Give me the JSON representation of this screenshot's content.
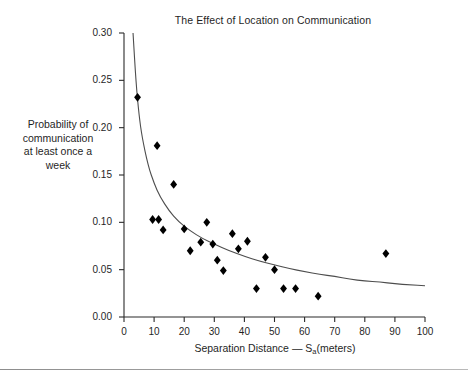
{
  "chart_data": {
    "type": "scatter",
    "title": "The Effect of Location on Communication",
    "xlabel": "Separation Distance — S",
    "xlabel_sub": "a",
    "xlabel_tail": "(meters)",
    "ylabel_lines": [
      "Probability of",
      "communication",
      "at least once a",
      "week"
    ],
    "xlim": [
      0,
      100
    ],
    "ylim": [
      0.0,
      0.3
    ],
    "xticks": [
      0,
      10,
      20,
      30,
      40,
      50,
      60,
      70,
      80,
      90,
      100
    ],
    "xtick_labels": [
      "0",
      "10",
      "20",
      "30",
      "40",
      "50",
      "60",
      "70",
      "80",
      "90",
      "100"
    ],
    "yticks": [
      0.0,
      0.05,
      0.1,
      0.15,
      0.2,
      0.25,
      0.3
    ],
    "ytick_labels": [
      "0.00",
      "0.05",
      "0.10",
      "0.15",
      "0.20",
      "0.25",
      "0.30"
    ],
    "grid": false,
    "legend": null,
    "marker": "diamond",
    "marker_color": "#000000",
    "curve_color": "#4d4d4d",
    "points": [
      {
        "x": 4.5,
        "y": 0.232
      },
      {
        "x": 11.0,
        "y": 0.181
      },
      {
        "x": 16.5,
        "y": 0.14
      },
      {
        "x": 9.5,
        "y": 0.103
      },
      {
        "x": 11.5,
        "y": 0.103
      },
      {
        "x": 13.0,
        "y": 0.092
      },
      {
        "x": 20.0,
        "y": 0.093
      },
      {
        "x": 22.0,
        "y": 0.07
      },
      {
        "x": 25.5,
        "y": 0.079
      },
      {
        "x": 27.5,
        "y": 0.1
      },
      {
        "x": 29.5,
        "y": 0.077
      },
      {
        "x": 31.0,
        "y": 0.06
      },
      {
        "x": 33.0,
        "y": 0.049
      },
      {
        "x": 36.0,
        "y": 0.088
      },
      {
        "x": 38.0,
        "y": 0.072
      },
      {
        "x": 41.0,
        "y": 0.08
      },
      {
        "x": 44.0,
        "y": 0.03
      },
      {
        "x": 47.0,
        "y": 0.063
      },
      {
        "x": 50.0,
        "y": 0.05
      },
      {
        "x": 53.0,
        "y": 0.03
      },
      {
        "x": 57.0,
        "y": 0.03
      },
      {
        "x": 64.5,
        "y": 0.022
      },
      {
        "x": 87.0,
        "y": 0.067
      }
    ],
    "fit_curve": {
      "description": "decaying fitted trend line",
      "points": [
        {
          "x": 3.0,
          "y": 0.3
        },
        {
          "x": 4.0,
          "y": 0.247
        },
        {
          "x": 5.0,
          "y": 0.213
        },
        {
          "x": 6.0,
          "y": 0.19
        },
        {
          "x": 8.0,
          "y": 0.16
        },
        {
          "x": 10.0,
          "y": 0.141
        },
        {
          "x": 12.0,
          "y": 0.127
        },
        {
          "x": 15.0,
          "y": 0.112
        },
        {
          "x": 18.0,
          "y": 0.101
        },
        {
          "x": 22.0,
          "y": 0.091
        },
        {
          "x": 26.0,
          "y": 0.083
        },
        {
          "x": 30.0,
          "y": 0.077
        },
        {
          "x": 35.0,
          "y": 0.07
        },
        {
          "x": 40.0,
          "y": 0.064
        },
        {
          "x": 45.0,
          "y": 0.059
        },
        {
          "x": 50.0,
          "y": 0.055
        },
        {
          "x": 55.0,
          "y": 0.051
        },
        {
          "x": 60.0,
          "y": 0.048
        },
        {
          "x": 65.0,
          "y": 0.045
        },
        {
          "x": 70.0,
          "y": 0.043
        },
        {
          "x": 75.0,
          "y": 0.04
        },
        {
          "x": 80.0,
          "y": 0.038
        },
        {
          "x": 85.0,
          "y": 0.037
        },
        {
          "x": 90.0,
          "y": 0.035
        },
        {
          "x": 95.0,
          "y": 0.034
        },
        {
          "x": 100.0,
          "y": 0.033
        }
      ]
    }
  }
}
